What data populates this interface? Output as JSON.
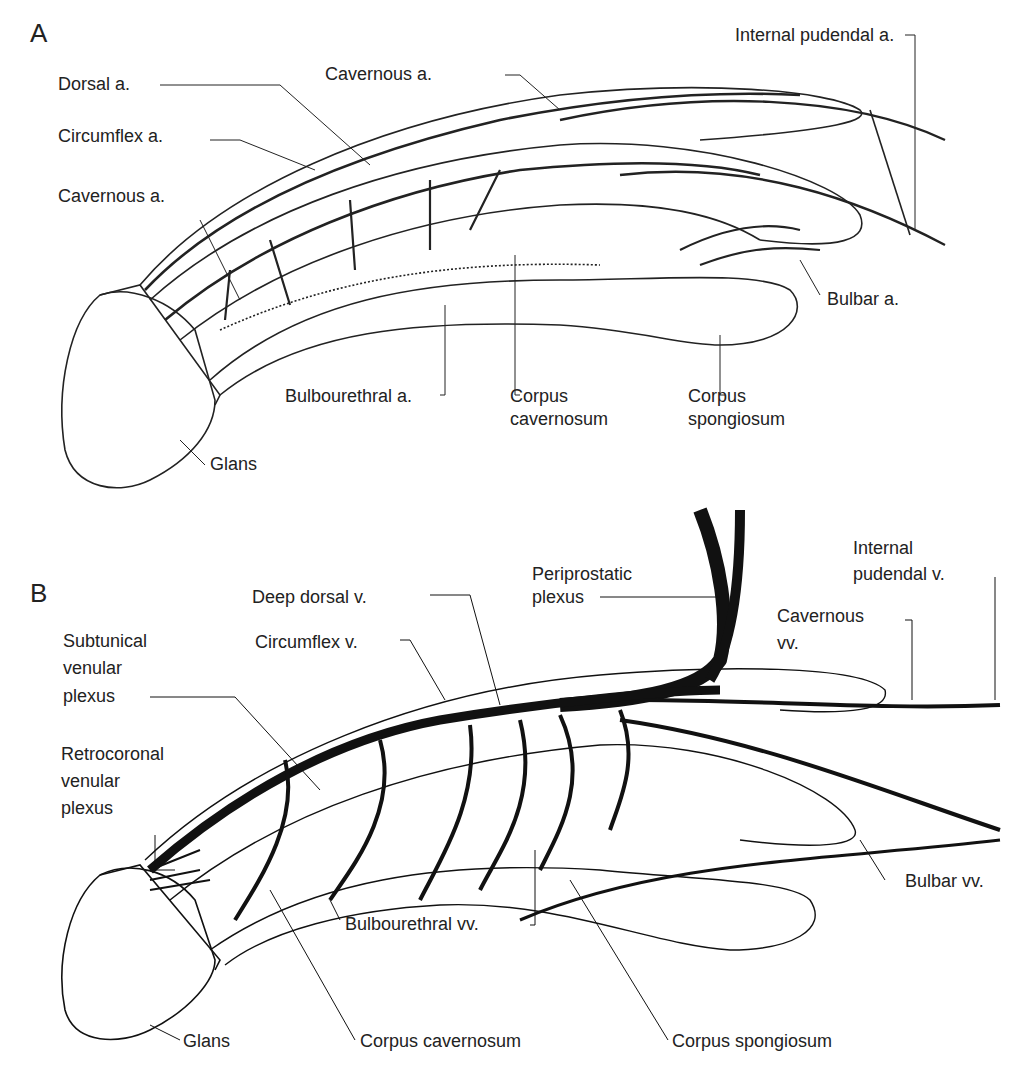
{
  "panels": {
    "a": {
      "letter": "A",
      "labels": {
        "dorsal_a": "Dorsal a.",
        "circumflex_a": "Circumflex a.",
        "cavernous_a_left": "Cavernous a.",
        "cavernous_a_top": "Cavernous a.",
        "internal_pudendal_a": "Internal pudendal a.",
        "bulbar_a": "Bulbar a.",
        "bulbourethral_a": "Bulbourethral a.",
        "corpus_cavernosum_1": "Corpus",
        "corpus_cavernosum_2": "cavernosum",
        "corpus_spongiosum_1": "Corpus",
        "corpus_spongiosum_2": "spongiosum",
        "glans": "Glans"
      }
    },
    "b": {
      "letter": "B",
      "labels": {
        "deep_dorsal_v": "Deep dorsal v.",
        "circumflex_v": "Circumflex v.",
        "periprostatic_1": "Periprostatic",
        "periprostatic_2": "plexus",
        "internal_pudendal_v_1": "Internal",
        "internal_pudendal_v_2": "pudendal v.",
        "cavernous_vv_1": "Cavernous",
        "cavernous_vv_2": "vv.",
        "subtunical_1": "Subtunical",
        "subtunical_2": "venular",
        "subtunical_3": "plexus",
        "retrocoronal_1": "Retrocoronal",
        "retrocoronal_2": "venular",
        "retrocoronal_3": "plexus",
        "bulbar_vv": "Bulbar vv.",
        "bulbourethral_vv": "Bulbourethral vv.",
        "corpus_cavernosum": "Corpus cavernosum",
        "corpus_spongiosum": "Corpus spongiosum",
        "glans": "Glans"
      }
    }
  }
}
